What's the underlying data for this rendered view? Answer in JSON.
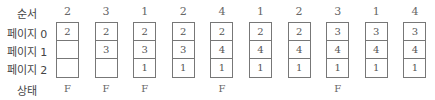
{
  "labels": {
    "sequence": "순서",
    "page0": "페이지 0",
    "page1": "페이지 1",
    "page2": "페이지 2",
    "status": "상태"
  },
  "columns": [
    {
      "ref": "2",
      "frames": [
        "2",
        "",
        ""
      ],
      "status": "F"
    },
    {
      "ref": "3",
      "frames": [
        "2",
        "3",
        ""
      ],
      "status": "F"
    },
    {
      "ref": "1",
      "frames": [
        "2",
        "3",
        "1"
      ],
      "status": "F"
    },
    {
      "ref": "2",
      "frames": [
        "2",
        "3",
        "1"
      ],
      "status": ""
    },
    {
      "ref": "4",
      "frames": [
        "2",
        "4",
        "1"
      ],
      "status": "F"
    },
    {
      "ref": "1",
      "frames": [
        "2",
        "4",
        "1"
      ],
      "status": ""
    },
    {
      "ref": "2",
      "frames": [
        "2",
        "4",
        "1"
      ],
      "status": ""
    },
    {
      "ref": "3",
      "frames": [
        "3",
        "4",
        "1"
      ],
      "status": "F"
    },
    {
      "ref": "1",
      "frames": [
        "3",
        "4",
        "1"
      ],
      "status": ""
    },
    {
      "ref": "4",
      "frames": [
        "3",
        "4",
        "1"
      ],
      "status": ""
    }
  ]
}
